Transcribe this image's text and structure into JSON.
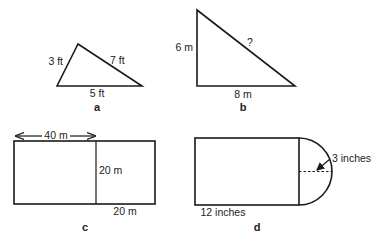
{
  "figures": {
    "a": {
      "caption": "a",
      "shape": "triangle",
      "sides": {
        "left": "3 ft",
        "right": "7 ft",
        "base": "5 ft"
      }
    },
    "b": {
      "caption": "b",
      "shape": "right-triangle",
      "sides": {
        "height": "6 m",
        "hypotenuse": "?",
        "base": "8 m"
      }
    },
    "c": {
      "caption": "c",
      "shape": "rectangle-split",
      "labels": {
        "top_width": "40 m",
        "divider_height": "20 m",
        "bottom_width": "20 m"
      }
    },
    "d": {
      "caption": "d",
      "shape": "rectangle-with-semicircle",
      "labels": {
        "radius": "3 inches",
        "length": "12 inches"
      }
    }
  }
}
